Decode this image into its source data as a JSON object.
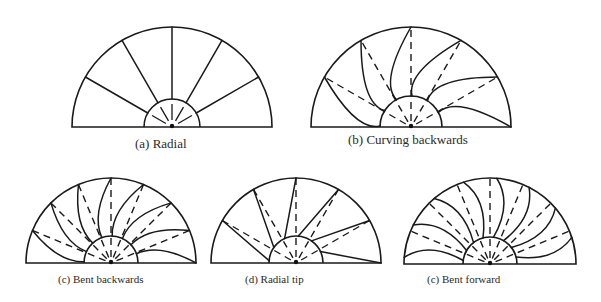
{
  "figure": {
    "background": "#ffffff",
    "line_color": "#1a1a1a",
    "panels": [
      {
        "id": "a",
        "caption": "(a) Radial",
        "caption_pos": [
          135,
          136
        ],
        "caption_class": "cap-top",
        "cx": 172,
        "cy": 127,
        "r": 100,
        "rin": 28,
        "blade_type": "radial",
        "blade_angles": [
          30,
          60,
          90,
          120,
          150
        ],
        "dashed": false
      },
      {
        "id": "b",
        "caption": "(b) Curving backwards",
        "caption_pos": [
          348,
          132
        ],
        "caption_class": "cap-top",
        "cx": 411,
        "cy": 127,
        "r": 100,
        "rin": 31,
        "blade_type": "curving-backwards",
        "blade_angles": [
          0,
          30,
          60,
          90,
          120,
          150
        ],
        "dashed": true
      },
      {
        "id": "c",
        "caption": "(c) Bent backwards",
        "caption_pos": [
          58,
          272
        ],
        "caption_class": "cap-bot",
        "cx": 111,
        "cy": 263,
        "r": 85,
        "rin": 27,
        "blade_type": "bent-backwards",
        "blade_angles": [
          0,
          22.5,
          45,
          67.5,
          90,
          112.5,
          135,
          157.5
        ],
        "dashed": true
      },
      {
        "id": "d",
        "caption": "(d) Radial tip",
        "caption_pos": [
          245,
          272
        ],
        "caption_class": "cap-bot",
        "cx": 296,
        "cy": 263,
        "r": 85,
        "rin": 27,
        "blade_type": "radial-tip",
        "blade_angles": [
          0,
          30,
          60,
          90,
          120,
          150
        ],
        "dashed": true
      },
      {
        "id": "e",
        "caption": "(c) Bent forward",
        "caption_pos": [
          427,
          272
        ],
        "caption_class": "cap-bot",
        "cx": 490,
        "cy": 264,
        "r": 86,
        "rin": 27,
        "blade_type": "bent-forward",
        "blade_angles": [
          0,
          22.5,
          45,
          67.5,
          90,
          112.5,
          135,
          157.5
        ],
        "dashed": true
      }
    ]
  }
}
